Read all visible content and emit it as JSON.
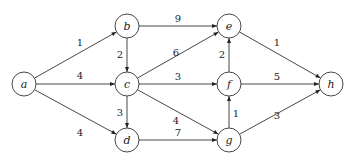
{
  "diagram": {
    "type": "weighted-directed-graph",
    "node_radius": 12,
    "colors": {
      "stroke": "#333333",
      "text": "#222222",
      "background": "#ffffff"
    },
    "nodes": [
      {
        "id": "a",
        "label": "a",
        "x": 24,
        "y": 84
      },
      {
        "id": "b",
        "label": "b",
        "x": 127,
        "y": 26
      },
      {
        "id": "c",
        "label": "c",
        "x": 127,
        "y": 84
      },
      {
        "id": "d",
        "label": "d",
        "x": 127,
        "y": 140
      },
      {
        "id": "e",
        "label": "e",
        "x": 229,
        "y": 26
      },
      {
        "id": "f",
        "label": "f",
        "x": 229,
        "y": 84
      },
      {
        "id": "g",
        "label": "g",
        "x": 229,
        "y": 140
      },
      {
        "id": "h",
        "label": "h",
        "x": 331,
        "y": 84
      }
    ],
    "edges": [
      {
        "from": "a",
        "to": "b",
        "weight": "1",
        "lx": 80,
        "ly": 46
      },
      {
        "from": "a",
        "to": "c",
        "weight": "4",
        "lx": 80,
        "ly": 79
      },
      {
        "from": "a",
        "to": "d",
        "weight": "4",
        "lx": 80,
        "ly": 136
      },
      {
        "from": "b",
        "to": "e",
        "weight": "9",
        "lx": 178,
        "ly": 22
      },
      {
        "from": "b",
        "to": "c",
        "weight": "2",
        "lx": 120,
        "ly": 58
      },
      {
        "from": "c",
        "to": "e",
        "weight": "6",
        "lx": 176,
        "ly": 56
      },
      {
        "from": "c",
        "to": "f",
        "weight": "3",
        "lx": 178,
        "ly": 80
      },
      {
        "from": "c",
        "to": "g",
        "weight": "4",
        "lx": 176,
        "ly": 124
      },
      {
        "from": "c",
        "to": "d",
        "weight": "3",
        "lx": 120,
        "ly": 116
      },
      {
        "from": "d",
        "to": "g",
        "weight": "7",
        "lx": 178,
        "ly": 136
      },
      {
        "from": "f",
        "to": "e",
        "weight": "2",
        "lx": 222,
        "ly": 58
      },
      {
        "from": "g",
        "to": "f",
        "weight": "1",
        "lx": 236,
        "ly": 117
      },
      {
        "from": "e",
        "to": "h",
        "weight": "1",
        "lx": 277,
        "ly": 46
      },
      {
        "from": "f",
        "to": "h",
        "weight": "5",
        "lx": 277,
        "ly": 80
      },
      {
        "from": "g",
        "to": "h",
        "weight": "3",
        "lx": 277,
        "ly": 119
      }
    ]
  }
}
